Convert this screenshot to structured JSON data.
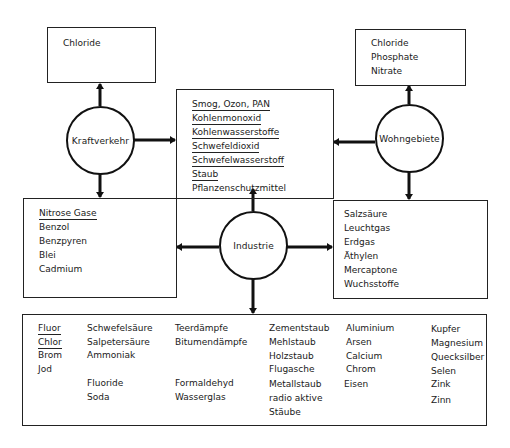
{
  "diagram": {
    "sources": {
      "traffic": "Kraftverkehr",
      "residential": "Wohngebiete",
      "industry": "Industrie"
    },
    "top_left_box": {
      "items": [
        "Chloride"
      ]
    },
    "top_right_box": {
      "items": [
        "Chloride",
        "Phosphate",
        "Nitrate"
      ]
    },
    "center_box": {
      "items": [
        {
          "text": "Smog, Ozon, PAN",
          "underline": "partial-Smog"
        },
        {
          "text": "Kohlenmonoxid",
          "underline": true
        },
        {
          "text": "Kohlenwasserstoffe",
          "underline": true
        },
        {
          "text": "Schwefeldioxid",
          "underline": true
        },
        {
          "text": "Schwefelwasserstoff",
          "underline": true
        },
        {
          "text": "Staub",
          "underline": true
        },
        {
          "text": "Pflanzenschutzmittel",
          "underline": false
        }
      ]
    },
    "middle_left_box": {
      "items": [
        {
          "text": "Nitrose Gase",
          "underline": true
        },
        {
          "text": "Benzol",
          "underline": false
        },
        {
          "text": "Benzpyren",
          "underline": false
        },
        {
          "text": "Blei",
          "underline": false
        },
        {
          "text": "Cadmium",
          "underline": false
        }
      ]
    },
    "middle_right_box": {
      "items": [
        "Salzsäure",
        "Leuchtgas",
        "Erdgas",
        "Äthylen",
        "Mercaptone",
        "Wuchsstoffe"
      ]
    },
    "bottom_box": {
      "columns": [
        {
          "items": [
            {
              "text": "Fluor",
              "underline": true
            },
            {
              "text": "Chlor",
              "underline": true
            },
            {
              "text": "Brom"
            },
            {
              "text": "Jod"
            }
          ]
        },
        {
          "items": [
            {
              "text": "Schwefelsäure"
            },
            {
              "text": "Salpetersäure"
            },
            {
              "text": "Ammoniak"
            },
            {
              "text": ""
            },
            {
              "text": "Fluoride"
            },
            {
              "text": "Soda"
            }
          ]
        },
        {
          "items": [
            {
              "text": "Teerdämpfe"
            },
            {
              "text": "Bitumendämpfe"
            },
            {
              "text": ""
            },
            {
              "text": ""
            },
            {
              "text": "Formaldehyd"
            },
            {
              "text": "Wasserglas"
            }
          ]
        },
        {
          "items": [
            {
              "text": "Zementstaub"
            },
            {
              "text": "Mehlstaub"
            },
            {
              "text": "Holzstaub"
            },
            {
              "text": "Flugasche"
            },
            {
              "text": "Metallstaub"
            },
            {
              "text": "radio aktive"
            },
            {
              "text": "Stäube"
            }
          ]
        },
        {
          "items": [
            {
              "text": "Aluminium"
            },
            {
              "text": "Arsen"
            },
            {
              "text": "Calcium"
            },
            {
              "text": "Chrom"
            },
            {
              "text": "Eisen"
            }
          ]
        },
        {
          "items": [
            {
              "text": "Kupfer"
            },
            {
              "text": "Magnesium"
            },
            {
              "text": "Quecksilber"
            },
            {
              "text": "Selen"
            },
            {
              "text": "Zink"
            },
            {
              "text": "Zinn"
            }
          ]
        }
      ]
    },
    "colors": {
      "ink": "#1a1a1a",
      "background": "#ffffff"
    }
  }
}
